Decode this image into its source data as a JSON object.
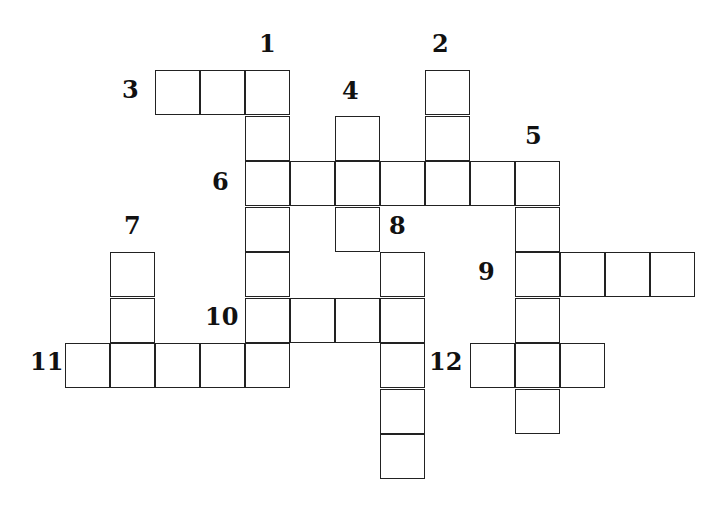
{
  "puzzle": {
    "type": "crossword",
    "grid": {
      "origin_x": 65,
      "origin_y": 70,
      "cell_size": 45
    },
    "clue_numbers": [
      {
        "n": "1",
        "x": 259,
        "y": 32
      },
      {
        "n": "2",
        "x": 432,
        "y": 32
      },
      {
        "n": "3",
        "x": 122,
        "y": 78
      },
      {
        "n": "4",
        "x": 342,
        "y": 79
      },
      {
        "n": "5",
        "x": 525,
        "y": 124
      },
      {
        "n": "6",
        "x": 212,
        "y": 170
      },
      {
        "n": "7",
        "x": 124,
        "y": 214
      },
      {
        "n": "8",
        "x": 389,
        "y": 214
      },
      {
        "n": "9",
        "x": 478,
        "y": 260
      },
      {
        "n": "10",
        "x": 205,
        "y": 305
      },
      {
        "n": "11",
        "x": 30,
        "y": 350
      },
      {
        "n": "12",
        "x": 429,
        "y": 350
      }
    ],
    "entries": [
      {
        "id": "3-across",
        "cells": [
          [
            2,
            0
          ],
          [
            3,
            0
          ],
          [
            4,
            0
          ]
        ]
      },
      {
        "id": "1-down",
        "cells": [
          [
            4,
            0
          ],
          [
            4,
            1
          ],
          [
            4,
            2
          ],
          [
            4,
            3
          ],
          [
            4,
            4
          ],
          [
            4,
            5
          ],
          [
            4,
            6
          ]
        ]
      },
      {
        "id": "2-down",
        "cells": [
          [
            8,
            0
          ],
          [
            8,
            1
          ],
          [
            8,
            2
          ]
        ]
      },
      {
        "id": "4-down",
        "cells": [
          [
            6,
            1
          ],
          [
            6,
            2
          ],
          [
            6,
            3
          ]
        ]
      },
      {
        "id": "6-across",
        "cells": [
          [
            4,
            2
          ],
          [
            5,
            2
          ],
          [
            6,
            2
          ],
          [
            7,
            2
          ],
          [
            8,
            2
          ],
          [
            9,
            2
          ],
          [
            10,
            2
          ]
        ]
      },
      {
        "id": "5-down",
        "cells": [
          [
            10,
            2
          ],
          [
            10,
            3
          ],
          [
            10,
            4
          ],
          [
            10,
            5
          ],
          [
            10,
            6
          ],
          [
            10,
            7
          ]
        ]
      },
      {
        "id": "7-down",
        "cells": [
          [
            1,
            4
          ],
          [
            1,
            5
          ],
          [
            1,
            6
          ]
        ]
      },
      {
        "id": "8-down",
        "cells": [
          [
            7,
            4
          ],
          [
            7,
            5
          ],
          [
            7,
            6
          ],
          [
            7,
            7
          ],
          [
            7,
            8
          ]
        ]
      },
      {
        "id": "9-across",
        "cells": [
          [
            10,
            4
          ],
          [
            11,
            4
          ],
          [
            12,
            4
          ],
          [
            13,
            4
          ]
        ]
      },
      {
        "id": "10-across",
        "cells": [
          [
            4,
            5
          ],
          [
            5,
            5
          ],
          [
            6,
            5
          ],
          [
            7,
            5
          ]
        ]
      },
      {
        "id": "11-across",
        "cells": [
          [
            0,
            6
          ],
          [
            1,
            6
          ],
          [
            2,
            6
          ],
          [
            3,
            6
          ],
          [
            4,
            6
          ]
        ]
      },
      {
        "id": "12-across",
        "cells": [
          [
            9,
            6
          ],
          [
            10,
            6
          ],
          [
            11,
            6
          ]
        ]
      }
    ]
  }
}
